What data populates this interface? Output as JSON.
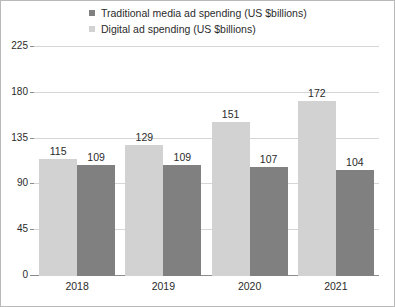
{
  "chart_data": {
    "type": "bar",
    "title": "",
    "subtitle": "",
    "xlabel": "",
    "ylabel": "",
    "categories": [
      "2018",
      "2019",
      "2020",
      "2021"
    ],
    "series": [
      {
        "name": "Digital ad spending (US $billions)",
        "color": "#d2d2d2",
        "values": [
          115,
          129,
          151,
          172
        ]
      },
      {
        "name": "Traditional media ad spending (US $billions)",
        "color": "#808080",
        "values": [
          109,
          109,
          107,
          104
        ]
      }
    ],
    "bar_order": [
      "Digital ad spending (US $billions)",
      "Traditional media ad spending (US $billions)"
    ],
    "ylim": [
      0,
      225
    ],
    "yticks": [
      0,
      45,
      90,
      135,
      180,
      225
    ],
    "ytick_labels": [
      "0",
      "45",
      "90",
      "135",
      "180",
      "225"
    ],
    "grid": true,
    "grid_axis": "y",
    "legend_position": "top",
    "data_labels": true,
    "legend": [
      {
        "label": "Traditional media ad spending (US $billions)",
        "color": "#808080"
      },
      {
        "label": "Digital ad spending (US $billions)",
        "color": "#d2d2d2"
      }
    ]
  },
  "colors": {
    "traditional": "#808080",
    "digital": "#d2d2d2",
    "gridline": "#d6d6d6",
    "axis": "#8c8c8c",
    "text": "#2b2b2b",
    "frame": "#b9b9b9",
    "background": "#ffffff"
  }
}
